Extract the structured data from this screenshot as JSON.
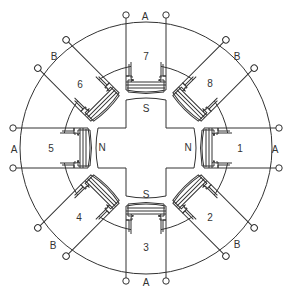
{
  "diagram": {
    "stroke_color": "#333333",
    "background": "#ffffff",
    "center": [
      146,
      148
    ],
    "outer_radius": 126,
    "inner_radius": 83,
    "poles": [
      {
        "number": "1",
        "angle_deg": 0,
        "phase": "A"
      },
      {
        "number": "2",
        "angle_deg": 45,
        "phase": "B"
      },
      {
        "number": "3",
        "angle_deg": 90,
        "phase": "A"
      },
      {
        "number": "4",
        "angle_deg": 135,
        "phase": "B"
      },
      {
        "number": "5",
        "angle_deg": 180,
        "phase": "A"
      },
      {
        "number": "6",
        "angle_deg": 225,
        "phase": "B"
      },
      {
        "number": "7",
        "angle_deg": 270,
        "phase": "A"
      },
      {
        "number": "8",
        "angle_deg": 315,
        "phase": "B"
      }
    ],
    "rotor": {
      "shape": "cross",
      "poles": {
        "top": "S",
        "bottom": "S",
        "left": "N",
        "right": "N"
      }
    },
    "phase_labels": {
      "right": "A",
      "left": "A",
      "top": "A",
      "bottom": "A",
      "top_right": "B",
      "top_left": "B",
      "bottom_right": "B",
      "bottom_left": "B"
    }
  }
}
